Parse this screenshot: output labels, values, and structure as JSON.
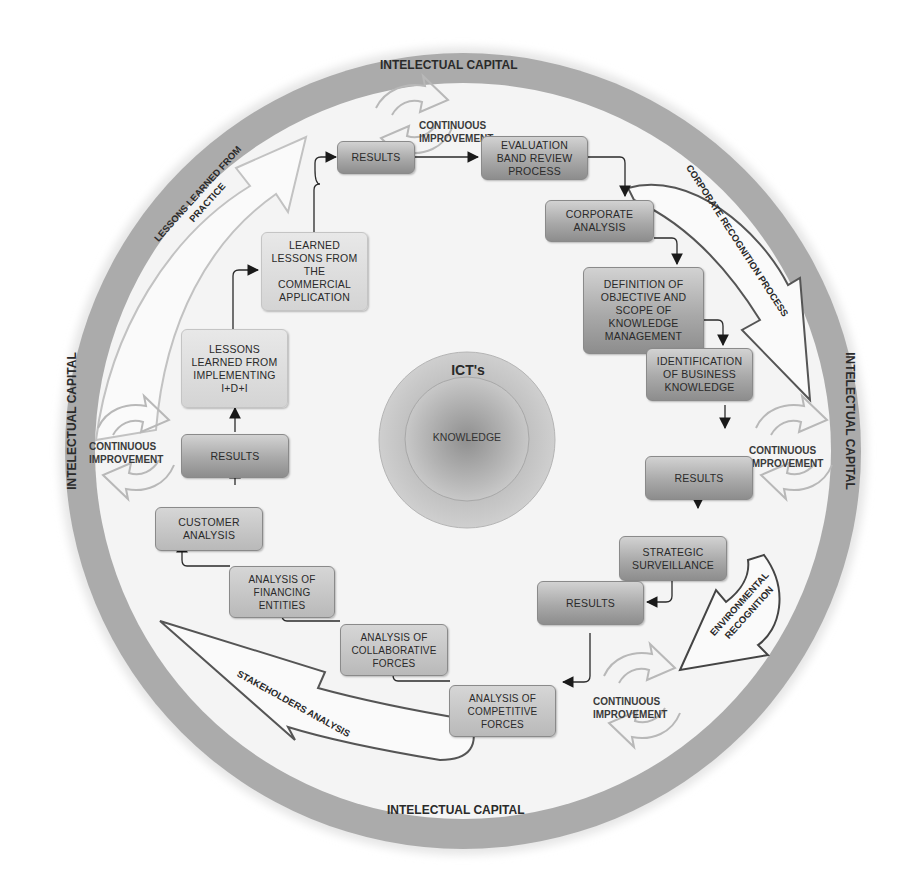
{
  "diagram": {
    "ring_label": "INTELECTUAL CAPITAL",
    "ring_labels": {
      "top": "INTELECTUAL CAPITAL",
      "bottom": "INTELECTUAL CAPITAL",
      "left": "INTELECTUAL CAPITAL",
      "right": "INTELECTUAL CAPITAL"
    },
    "center": {
      "outer_label": "ICT's",
      "inner_label": "KNOWLEDGE"
    },
    "continuous_improvement": {
      "top": [
        "CONTINUOUS",
        "IMPROVEMENT"
      ],
      "left": [
        "CONTINUOUS",
        "IMPROVEMENT"
      ],
      "right": [
        "CONTINUOUS",
        "IMPROVEMENT"
      ],
      "bottom": [
        "CONTINUOUS",
        "IMPROVEMENT"
      ]
    },
    "big_arrows": {
      "lessons_practice": [
        "LESSONS LEARNED FROM",
        "PRACTICE"
      ],
      "corporate_recognition": "CORPORATE RECOGNITION PROCESS",
      "environmental_recognition": [
        "ENVIRONMENTAL",
        "RECOGNITION"
      ],
      "stakeholders_analysis": "STAKEHOLDERS ANALYSIS"
    },
    "boxes": {
      "results_top": "RESULTS",
      "evaluation": "EVALUATION BAND REVIEW PROCESS",
      "corporate_analysis": "CORPORATE ANALYSIS",
      "definition": "DEFINITION OF OBJECTIVE AND SCOPE OF KNOWLEDGE MANAGEMENT",
      "identification": "IDENTIFICATION OF BUSINESS KNOWLEDGE",
      "results_right": "RESULTS",
      "strategic": "STRATEGIC SURVEILLANCE",
      "results_bottom": "RESULTS",
      "competitive": "ANALYSIS OF COMPETITIVE FORCES",
      "collaborative": "ANALYSIS OF COLLABORATIVE FORCES",
      "financing": "ANALYSIS OF FINANCING ENTITIES",
      "customer": "CUSTOMER ANALYSIS",
      "results_left": "RESULTS",
      "lessons_idi": "LESSONS LEARNED FROM IMPLEMENTING I+D+I",
      "lessons_commercial": "LEARNED LESSONS FROM THE COMMERCIAL APPLICATION"
    },
    "colors": {
      "ring": "#a9a9a9",
      "inner_bg": "#f3f3f3",
      "box_dark": "#9c9c9c",
      "box_light": "#dcdcdc",
      "line": "#333333",
      "outline_arrow": "#6a6a6a"
    }
  }
}
